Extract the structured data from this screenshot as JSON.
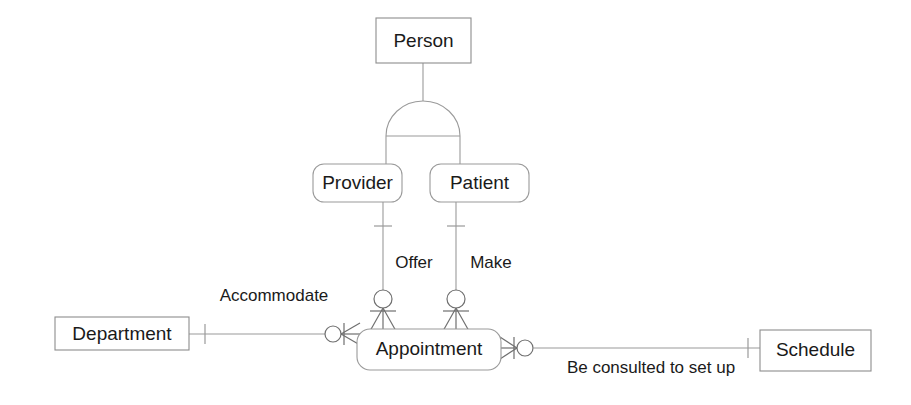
{
  "diagram": {
    "notation": "crow-foot",
    "colors": {
      "background": "#ffffff",
      "line": "#9a9a9a",
      "line_dark": "#6f6f6f",
      "text": "#1a1a1a",
      "box_fill": "#ffffff"
    },
    "entities": [
      {
        "id": "person",
        "label": "Person",
        "shape": "rectangle",
        "x": 376,
        "y": 18,
        "w": 95,
        "h": 45
      },
      {
        "id": "provider",
        "label": "Provider",
        "shape": "rounded-rectangle",
        "x": 313,
        "y": 164,
        "w": 89,
        "h": 38
      },
      {
        "id": "patient",
        "label": "Patient",
        "shape": "rounded-rectangle",
        "x": 430,
        "y": 164,
        "w": 99,
        "h": 38
      },
      {
        "id": "appointment",
        "label": "Appointment",
        "shape": "rounded-rectangle",
        "x": 357,
        "y": 329,
        "w": 144,
        "h": 41
      },
      {
        "id": "department",
        "label": "Department",
        "shape": "rectangle",
        "x": 55,
        "y": 317,
        "w": 134,
        "h": 33
      },
      {
        "id": "schedule",
        "label": "Schedule",
        "shape": "rectangle",
        "x": 760,
        "y": 330,
        "w": 111,
        "h": 41
      }
    ],
    "relationships": [
      {
        "id": "offer",
        "label": "Offer",
        "from": "provider",
        "to": "appointment",
        "x": 414,
        "y": 264
      },
      {
        "id": "make",
        "label": "Make",
        "from": "patient",
        "to": "appointment",
        "x": 491,
        "y": 264
      },
      {
        "id": "accommodate",
        "label": "Accommodate",
        "from": "department",
        "to": "appointment",
        "x": 274,
        "y": 297
      },
      {
        "id": "consulted",
        "label": "Be consulted to set up",
        "from": "appointment",
        "to": "schedule",
        "x": 651,
        "y": 369
      }
    ],
    "generalization": {
      "supertype": "person",
      "subtypes": [
        "provider",
        "patient"
      ],
      "symbol": "arc"
    }
  }
}
